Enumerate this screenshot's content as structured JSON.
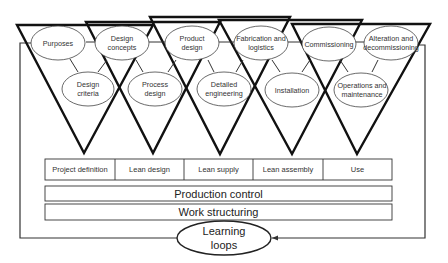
{
  "diagram": {
    "type": "lean project delivery system",
    "phases_top": [
      {
        "label": "Purposes"
      },
      {
        "label": "Design concepts"
      },
      {
        "label": "Product design"
      },
      {
        "label": "Fabrication and logistics"
      },
      {
        "label": "Commissioning"
      },
      {
        "label": "Alteration and decommissioning"
      }
    ],
    "phases_bottom": [
      {
        "label": "Design criteria"
      },
      {
        "label": "Process design"
      },
      {
        "label": "Detailed engineering"
      },
      {
        "label": "Installation"
      },
      {
        "label": "Operations and maintenance"
      }
    ],
    "modules": [
      {
        "label": "Project definition"
      },
      {
        "label": "Lean design"
      },
      {
        "label": "Lean supply"
      },
      {
        "label": "Lean assembly"
      },
      {
        "label": "Use"
      }
    ],
    "production_control": "Production control",
    "work_structuring": "Work structuring",
    "learning_loops": "Learning loops",
    "colors": {
      "line": "#111111",
      "thin_line": "#333333",
      "background": "#ffffff"
    }
  }
}
